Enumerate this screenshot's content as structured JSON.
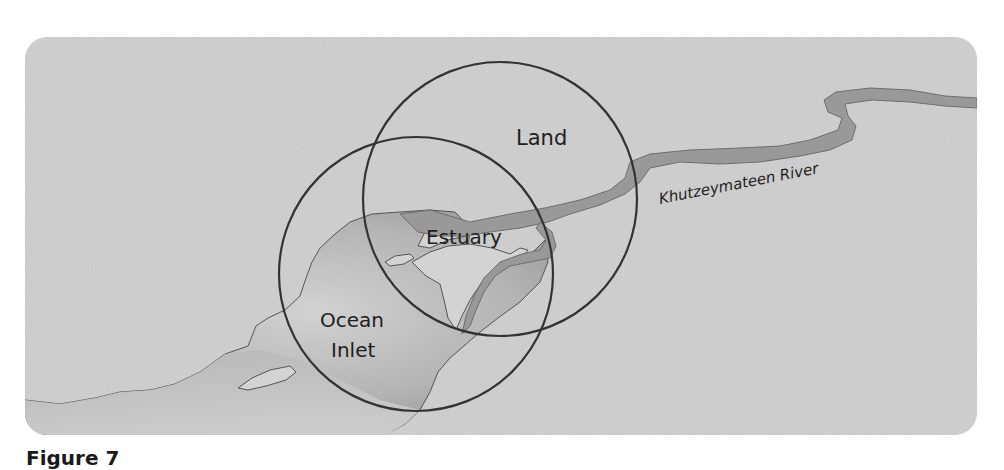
{
  "figure": {
    "type": "map-diagram",
    "caption_partial": "Figure 7"
  },
  "labels": {
    "land": "Land",
    "estuary": "Estuary",
    "ocean_line1": "Ocean",
    "ocean_line2": "Inlet",
    "river": "Khutzeymateen River"
  },
  "circles": [
    {
      "name": "Land",
      "cx": 500,
      "cy": 199,
      "r": 137
    },
    {
      "name": "Ocean Inlet",
      "cx": 416,
      "cy": 274,
      "r": 137
    }
  ],
  "colors": {
    "background": "#ffffff",
    "land": "#d3d3d3",
    "river": "#999999",
    "ocean_light": "#c8c8c8",
    "ocean_dark": "#8e8e8e",
    "circle_stroke": "#333333",
    "text": "#1e1e1e"
  }
}
